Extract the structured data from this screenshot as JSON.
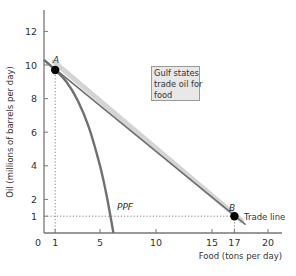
{
  "chart_data": {
    "type": "line",
    "title": "",
    "xlabel": "Food (tons per day)",
    "ylabel": "Oil (millions of barrels per day)",
    "xlim": [
      0,
      22
    ],
    "ylim": [
      0,
      13
    ],
    "x_ticks": [
      0,
      1,
      5,
      10,
      15,
      17,
      20
    ],
    "y_ticks": [
      0,
      1,
      2,
      4,
      6,
      8,
      10,
      12
    ],
    "grid": false,
    "legend": "none",
    "series": [
      {
        "name": "PPF",
        "style": "curve",
        "color": "#707070",
        "points": [
          [
            0,
            10.3
          ],
          [
            1,
            9.7
          ],
          [
            2,
            9.0
          ],
          [
            3,
            7.9
          ],
          [
            4,
            6.3
          ],
          [
            5,
            4.0
          ],
          [
            5.6,
            2.2
          ],
          [
            6.2,
            0
          ]
        ]
      },
      {
        "name": "Trade line",
        "style": "straight",
        "color": "#6e6e6e",
        "shadow_color": "#d4d4d4",
        "points": [
          [
            0,
            10.3
          ],
          [
            18,
            0.5
          ]
        ]
      }
    ],
    "points": [
      {
        "label": "A",
        "x": 1,
        "y": 9.7
      },
      {
        "label": "B",
        "x": 17,
        "y": 1
      }
    ],
    "reference_lines": [
      {
        "type": "dotted",
        "from": [
          1,
          0
        ],
        "to": [
          1,
          9.7
        ]
      },
      {
        "type": "dotted",
        "from": [
          0,
          1
        ],
        "to": [
          17,
          1
        ]
      },
      {
        "type": "dotted",
        "from": [
          17,
          0
        ],
        "to": [
          17,
          1
        ]
      }
    ],
    "annotations": [
      {
        "text": "Gulf states trade oil for food",
        "lines": [
          "Gulf states",
          "trade oil for",
          "food"
        ],
        "position": "box upper-middle"
      },
      {
        "text": "PPF",
        "near": [
          6,
          2
        ]
      },
      {
        "text": "Trade line",
        "near": [
          18.5,
          1
        ]
      }
    ]
  },
  "labels": {
    "x_axis_title": "Food (tons per day)",
    "y_axis_title": "Oil (millions of barrels per day)",
    "ppf": "PPF",
    "trade_line": "Trade line",
    "point_a": "A",
    "point_b": "B",
    "callout": [
      "Gulf states",
      "trade oil for",
      "food"
    ]
  }
}
